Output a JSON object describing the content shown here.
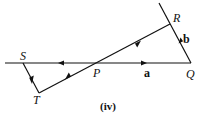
{
  "diagram": {
    "caption": "(iv)",
    "points": {
      "S": "S",
      "P": "P",
      "Q": "Q",
      "R": "R",
      "T": "T"
    },
    "vectors": {
      "a": "a",
      "b": "b"
    },
    "line_color": "#111111"
  }
}
